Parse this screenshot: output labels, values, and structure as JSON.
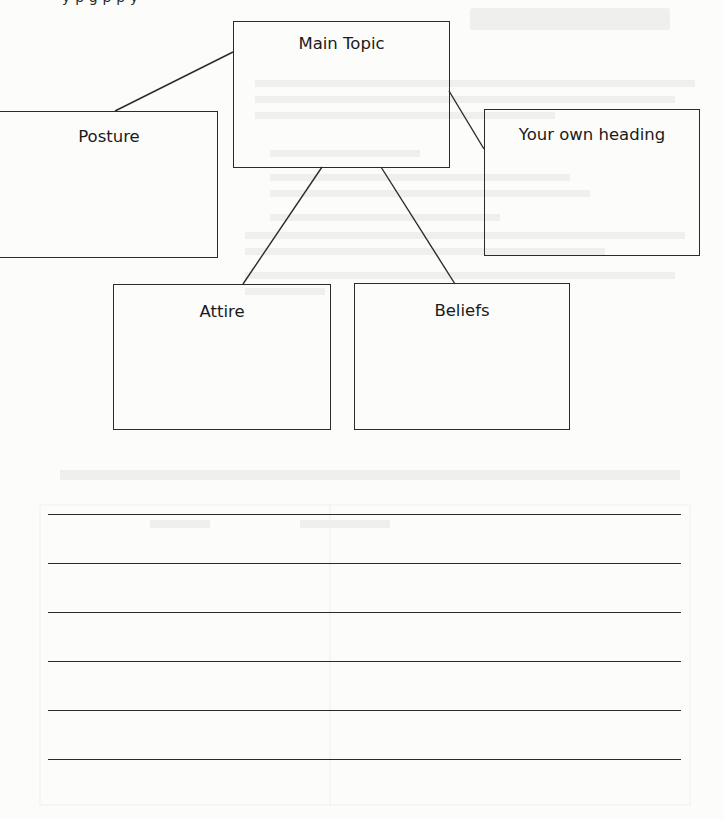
{
  "page": {
    "top_cutoff_text": "y         p       g        p             p               y"
  },
  "concept_map": {
    "main_topic": {
      "label": "Main Topic"
    },
    "branches": [
      {
        "id": "posture",
        "label": "Posture"
      },
      {
        "id": "your-own-heading",
        "label": "Your own heading"
      },
      {
        "id": "attire",
        "label": "Attire"
      },
      {
        "id": "beliefs",
        "label": "Beliefs"
      }
    ]
  },
  "writing_lines": {
    "count": 6
  },
  "colors": {
    "paper": "#fcfcfb",
    "ink": "#2b2b2b"
  }
}
